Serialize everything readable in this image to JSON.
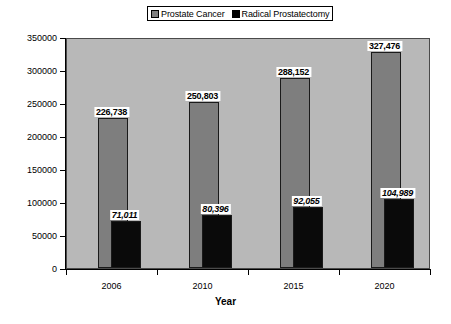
{
  "chart_data": {
    "type": "bar",
    "title": "",
    "xlabel": "Year",
    "ylabel": "",
    "categories": [
      "2006",
      "2010",
      "2015",
      "2020"
    ],
    "ylim": [
      0,
      350000
    ],
    "ytick_labels": [
      "0",
      "50000",
      "100000",
      "150000",
      "200000",
      "250000",
      "300000",
      "350000"
    ],
    "ytick_values": [
      0,
      50000,
      100000,
      150000,
      200000,
      250000,
      300000,
      350000
    ],
    "grid": false,
    "legend_position": "top-center",
    "series": [
      {
        "name": "Prostate Cancer",
        "color": "#7e7e7e",
        "values": [
          226738,
          250803,
          288152,
          327476
        ],
        "labels": [
          "226,738",
          "250,803",
          "288,152",
          "327,476"
        ]
      },
      {
        "name": "Radical Prostatectomy",
        "color": "#0a0a0a",
        "values": [
          71011,
          80396,
          92055,
          104989
        ],
        "labels": [
          "71,011",
          "80,396",
          "92,055",
          "104,989"
        ]
      }
    ]
  },
  "legend": {
    "entries": [
      {
        "label": "Prostate Cancer",
        "swatch": "series-gray"
      },
      {
        "label": "Radical Prostatectomy",
        "swatch": "series-black"
      }
    ]
  },
  "axis": {
    "x_title": "Year"
  },
  "colors": {
    "plot_background": "#b8b8b8",
    "series_prostate_cancer": "#7e7e7e",
    "series_radical_prostatectomy": "#0a0a0a",
    "axis": "#000000",
    "page_background": "#ffffff"
  }
}
